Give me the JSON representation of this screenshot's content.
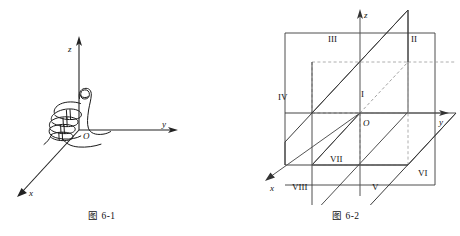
{
  "page": {
    "background": "#ffffff",
    "ink": "#111111",
    "width": 460,
    "height": 236
  },
  "figures": [
    {
      "id": "figure-6-1",
      "caption": "图 6-1",
      "description": "right-hand-rule-fist-with-thumb-up",
      "axes": [
        {
          "name": "z-axis",
          "label": "z",
          "direction": "up"
        },
        {
          "name": "y-axis",
          "label": "y",
          "direction": "right"
        },
        {
          "name": "x-axis",
          "label": "x",
          "direction": "down-left"
        }
      ],
      "origin_label": "O"
    },
    {
      "id": "figure-6-2",
      "caption": "图 6-2",
      "description": "three-coordinate-planes-dividing-space-into-eight-octants",
      "axes": [
        {
          "name": "z-axis",
          "label": "z",
          "direction": "up"
        },
        {
          "name": "y-axis",
          "label": "y",
          "direction": "right"
        },
        {
          "name": "x-axis",
          "label": "x",
          "direction": "down-left"
        }
      ],
      "origin_label": "O",
      "octants": [
        {
          "label": "I",
          "x": 364,
          "y": 94
        },
        {
          "label": "II",
          "x": 412,
          "y": 38
        },
        {
          "label": "III",
          "x": 332,
          "y": 37
        },
        {
          "label": "IV",
          "x": 285,
          "y": 96
        },
        {
          "label": "V",
          "x": 372,
          "y": 186
        },
        {
          "label": "VI",
          "x": 420,
          "y": 172
        },
        {
          "label": "VII",
          "x": 333,
          "y": 158
        },
        {
          "label": "VIII",
          "x": 296,
          "y": 186
        }
      ],
      "planes": [
        {
          "name": "yOz-plane"
        },
        {
          "name": "xOy-plane"
        },
        {
          "name": "xOz-plane"
        }
      ]
    }
  ]
}
